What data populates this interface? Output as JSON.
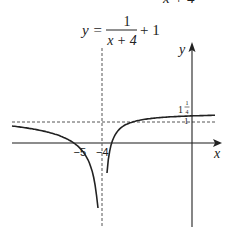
{
  "chart_data": {
    "type": "line",
    "title_top_fragment": "x + 4",
    "title": {
      "lhs": "y =",
      "numerator": "1",
      "denominator": "x + 4",
      "rhs": "+ 1"
    },
    "equation": "y = 1/(x+4) + 1",
    "xlabel": "x",
    "ylabel": "y",
    "x_ticks": [
      {
        "value": -5,
        "label": "−5"
      },
      {
        "value": -4,
        "label": "−4"
      }
    ],
    "y_ticks": [
      {
        "value": 1.25,
        "label_whole": "1",
        "label_num": "1",
        "label_den": "4"
      },
      {
        "value": 1,
        "label": "1"
      }
    ],
    "asymptotes": {
      "vertical": {
        "x": -4,
        "style": "dashed"
      },
      "horizontal": {
        "y": 1,
        "style": "dashed"
      }
    },
    "key_points": [
      {
        "name": "x-intercept",
        "x": -5,
        "y": 0
      },
      {
        "name": "y-intercept",
        "x": 0,
        "y": 1.25
      }
    ],
    "series": [
      {
        "name": "left-branch",
        "x_range": [
          -9,
          -4.08
        ]
      },
      {
        "name": "right-branch",
        "x_range": [
          -3.93,
          1.8
        ]
      }
    ],
    "grid": false,
    "legend": "none"
  }
}
